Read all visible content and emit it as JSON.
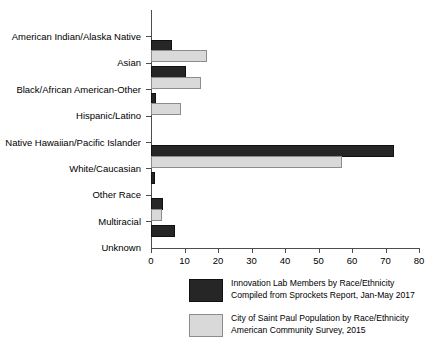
{
  "chart_data": {
    "type": "bar",
    "orientation": "horizontal",
    "title": "",
    "xlabel": "",
    "ylabel": "",
    "xlim": [
      0,
      80
    ],
    "xticks": [
      0,
      10,
      20,
      30,
      40,
      50,
      60,
      70,
      80
    ],
    "xtick_labels": [
      "0",
      "10",
      "20",
      "30",
      "40",
      "50",
      "60",
      "70",
      "80"
    ],
    "grid": false,
    "legend_position": "bottom",
    "categories": [
      "American Indian/Alaska Native",
      "Asian",
      "Black/African American-Other",
      "Hispanic/Latino",
      "Native Hawaiian/Pacific Islander",
      "White/Caucasian",
      "Other Race",
      "Multiracial",
      "Unknown"
    ],
    "series": [
      {
        "name": "Innovation Lab Members by Race/Ethnicity",
        "subtitle": "Compiled from Sprockets Report, Jan-May 2017",
        "color": "#262626",
        "values": [
          0,
          5.8,
          9.8,
          1.0,
          0,
          71.9,
          0.6,
          3.0,
          6.7
        ]
      },
      {
        "name": "City of Saint Paul Population by Race/Ethnicity",
        "subtitle": "American Community Survey, 2015",
        "color": "#d9d9d9",
        "values": [
          0,
          16.2,
          14.4,
          8.3,
          0,
          56.3,
          0,
          2.7,
          0
        ]
      }
    ]
  },
  "legend": {
    "entries": [
      {
        "line1": "Innovation Lab Members by Race/Ethnicity",
        "line2": "Compiled from Sprockets Report, Jan-May 2017"
      },
      {
        "line1": "City of Saint Paul Population by Race/Ethnicity",
        "line2": "American Community Survey, 2015"
      }
    ]
  }
}
